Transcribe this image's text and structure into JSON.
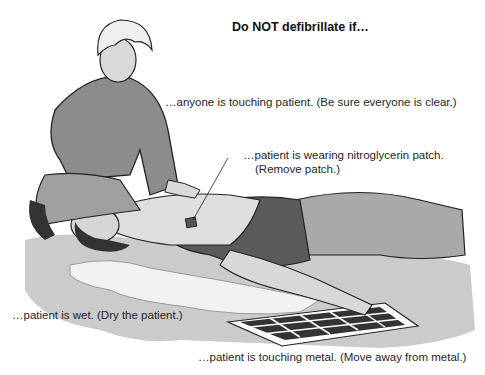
{
  "title": "Do NOT defibrillate if…",
  "callouts": {
    "touching_patient": "…anyone is touching patient. (Be sure everyone is clear.)",
    "nitro_patch_line1": "…patient is wearing nitroglycerin patch.",
    "nitro_patch_line2": "(Remove patch.)",
    "wet": "…patient is wet. (Dry the patient.)",
    "metal": "…patient is touching metal. (Move away from metal.)"
  },
  "illustration": {
    "figures": [
      "rescuer-kneeling",
      "patient-lying-supine",
      "water-puddle",
      "metal-grate",
      "nitroglycerin-patch"
    ],
    "colors": {
      "ground": "#c8c8c8",
      "clothing": "#8a8a8a",
      "dark_clothing": "#555555",
      "skin": "#dcdcdc",
      "outline": "#222222"
    }
  }
}
